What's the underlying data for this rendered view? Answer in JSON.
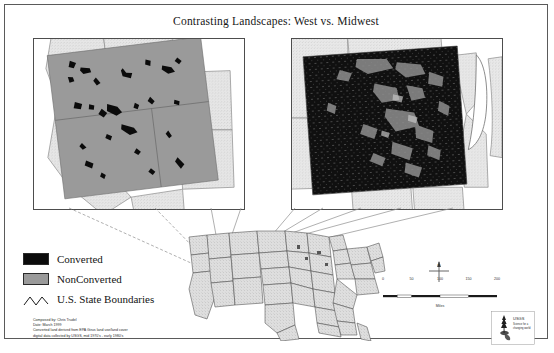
{
  "poster": {
    "title": "Contrasting Landscapes: West vs. Midwest"
  },
  "insets": [
    {
      "name": "west",
      "region": "West",
      "description": "Tilted gray rectangle over western states with sparse black converted patches"
    },
    {
      "name": "midwest",
      "region": "Midwest",
      "description": "Tilted rectangle over midwestern states almost entirely black converted land, Lake Michigan at right"
    }
  ],
  "legend": {
    "items": [
      {
        "label": "Converted",
        "symbol": "filled-swatch",
        "color": "#0c0c0c"
      },
      {
        "label": "NonConverted",
        "symbol": "filled-swatch",
        "color": "#9a9a9a"
      },
      {
        "label": "U.S. State Boundaries",
        "symbol": "zigzag-line",
        "color": "#1a1a1a"
      }
    ]
  },
  "credits": {
    "lines": [
      "Composed by: Chris Trudel",
      "Date: March 1999",
      "Converted land derived from EPA Girus land use/land cover",
      "digital data collected by USGS, mid 1970's - early 1980's"
    ]
  },
  "scalebar": {
    "ticks": [
      "0",
      "50",
      "100",
      "150",
      "200"
    ],
    "units": "Miles"
  },
  "compass": {
    "label": "N",
    "icon": "north-arrow-icon"
  },
  "logo": {
    "icon": "agency-logo-icon",
    "lines": [
      "USGS",
      "Science for a",
      "changing world"
    ]
  },
  "colors": {
    "converted": "#0c0c0c",
    "nonconverted": "#9a9a9a",
    "map_fill": "#dcdcdc",
    "boundary": "#4a4a4a",
    "frame": "#5a5a5a"
  }
}
